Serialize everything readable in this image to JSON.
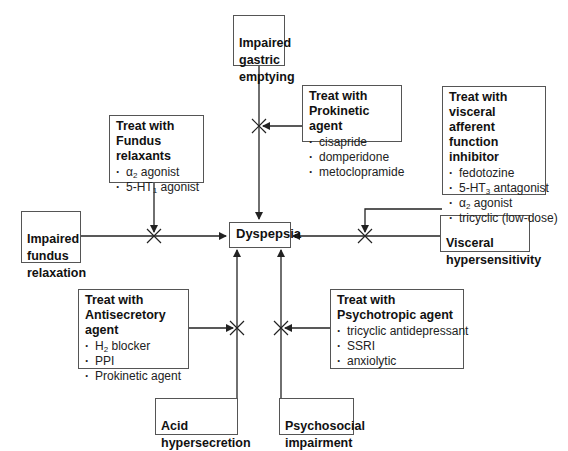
{
  "diagram": {
    "center": {
      "label": "Dyspepsia"
    },
    "causes": {
      "gastric": {
        "label": "Impaired\ngastric\nemptying"
      },
      "fundus": {
        "label": "Impaired\nfundus\nrelaxation"
      },
      "visceral": {
        "label": "Visceral\nhypersensitivity"
      },
      "acid": {
        "label": "Acid\nhypersecretion"
      },
      "psychosocial": {
        "label": "Psychosocial\nimpairment"
      }
    },
    "treatments": {
      "prokinetic": {
        "title": "Treat with\nProkinetic agent",
        "items": [
          "cisapride",
          "domperidone",
          "metoclopramide"
        ]
      },
      "fundus_relaxants": {
        "title": "Treat with\nFundus relaxants",
        "items": [
          {
            "pre": "α",
            "sub": "2",
            "post": " agonist"
          },
          {
            "pre": "5-HT",
            "sub": "1",
            "post": " agonist"
          }
        ]
      },
      "visceral_afferent": {
        "title": "Treat with\nvisceral afferent\nfunction inhibitor",
        "items": [
          {
            "pre": "fedotozine",
            "sub": "",
            "post": ""
          },
          {
            "pre": "5-HT",
            "sub": "3",
            "post": " antagonist"
          },
          {
            "pre": "α",
            "sub": "2",
            "post": " agonist"
          },
          {
            "pre": "tricyclic (low-dose)",
            "sub": "",
            "post": ""
          }
        ]
      },
      "antisecretory": {
        "title": "Treat with\nAntisecretory agent",
        "items": [
          {
            "pre": "H",
            "sub": "2",
            "post": " blocker"
          },
          {
            "pre": "PPI",
            "sub": "",
            "post": ""
          },
          {
            "pre": "Prokinetic agent",
            "sub": "",
            "post": ""
          }
        ]
      },
      "psychotropic": {
        "title": "Treat with\nPsychotropic agent",
        "items": [
          "tricyclic antidepressant",
          "SSRI",
          "anxiolytic"
        ]
      }
    },
    "colors": {
      "line": "#222222",
      "border": "#555555",
      "background": "#ffffff"
    }
  }
}
